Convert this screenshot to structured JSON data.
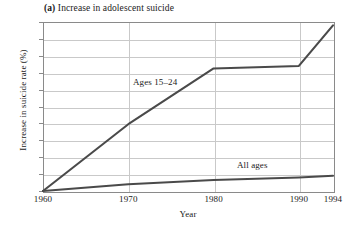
{
  "chart_data": {
    "type": "line",
    "title": "(a) Increase in adolescent suicide",
    "panel_letter": "(a)",
    "title_rest": " Increase in adolescent suicide",
    "xlabel": "Year",
    "ylabel": "Increase in suicide rate (%)",
    "x": [
      1960,
      1970,
      1980,
      1990,
      1994
    ],
    "xtick_labels": [
      "1960",
      "1970",
      "1980",
      "1990",
      "1994"
    ],
    "ytick_labels": [
      "0",
      "20",
      "40",
      "60",
      "80",
      "100",
      "120",
      "140",
      "160",
      "180",
      "200"
    ],
    "ytick_values": [
      0,
      20,
      40,
      60,
      80,
      100,
      120,
      140,
      160,
      180,
      200
    ],
    "xlim": [
      1960,
      1994
    ],
    "ylim": [
      0,
      200
    ],
    "grid": true,
    "legend_position": "inline-annotations",
    "series": [
      {
        "name": "Ages 15–24",
        "label": "Ages 15–24",
        "color": "#4a4a4a",
        "values": [
          0,
          79,
          145,
          148,
          196
        ]
      },
      {
        "name": "All ages",
        "label": "All ages",
        "color": "#4a4a4a",
        "values": [
          0,
          8,
          13,
          16,
          18
        ]
      }
    ],
    "colors": {
      "line": "#4a4a4a",
      "grid": "#c9c9c9",
      "frame": "#8a8a8a",
      "text": "#1a1a1a",
      "background": "#ffffff"
    }
  }
}
